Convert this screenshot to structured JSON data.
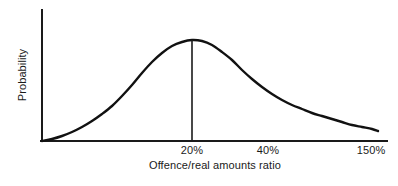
{
  "chart_data": {
    "type": "line",
    "title": "",
    "subtitle": "",
    "xlabel": "Offence/real amounts ratio",
    "ylabel": "Probability",
    "grid": false,
    "legend": null,
    "xlim": [
      0,
      160
    ],
    "ylim": [
      0,
      1.12
    ],
    "xticks": [
      {
        "value": 20,
        "label": "20%",
        "px": 192
      },
      {
        "value": 40,
        "label": "40%",
        "px": 268
      },
      {
        "value": 150,
        "label": "150%",
        "px": 371
      }
    ],
    "yticks": [],
    "annotations": [
      {
        "kind": "vertical-drop-line",
        "at_x": 20,
        "at_x_label": "20%",
        "from_y": 1.0,
        "to_y": 0.0,
        "note": "mode marker at peak of distribution"
      }
    ],
    "series": [
      {
        "name": "Probability density",
        "color": "#111111",
        "x": [
          0,
          5,
          10,
          15,
          20,
          25,
          30,
          35,
          40,
          45,
          50,
          55,
          60,
          65,
          70,
          75,
          80,
          85,
          90,
          95,
          100,
          110,
          120,
          130,
          140,
          150,
          160
        ],
        "values": [
          0.0,
          0.03,
          0.09,
          0.2,
          0.36,
          0.56,
          0.76,
          0.92,
          1.0,
          0.98,
          0.9,
          0.79,
          0.67,
          0.56,
          0.47,
          0.4,
          0.35,
          0.31,
          0.28,
          0.26,
          0.24,
          0.21,
          0.19,
          0.16,
          0.14,
          0.12,
          0.1
        ],
        "curve_pixels": [
          [
            42,
            141
          ],
          [
            52,
            139
          ],
          [
            62,
            136
          ],
          [
            72,
            132
          ],
          [
            82,
            127
          ],
          [
            92,
            121
          ],
          [
            102,
            114
          ],
          [
            112,
            106
          ],
          [
            122,
            96
          ],
          [
            132,
            85
          ],
          [
            142,
            73
          ],
          [
            152,
            62
          ],
          [
            162,
            53
          ],
          [
            172,
            46
          ],
          [
            182,
            42
          ],
          [
            192,
            40
          ],
          [
            202,
            41
          ],
          [
            212,
            45
          ],
          [
            222,
            52
          ],
          [
            232,
            60
          ],
          [
            242,
            70
          ],
          [
            252,
            79
          ],
          [
            262,
            87
          ],
          [
            272,
            94
          ],
          [
            282,
            100
          ],
          [
            292,
            105
          ],
          [
            302,
            109
          ],
          [
            312,
            113
          ],
          [
            322,
            116
          ],
          [
            332,
            119
          ],
          [
            342,
            122
          ],
          [
            352,
            125
          ],
          [
            362,
            127
          ],
          [
            372,
            129
          ],
          [
            378,
            131
          ]
        ]
      }
    ]
  },
  "axes": {
    "y_axis_name": "y-axis-line",
    "x_axis_name": "x-axis-line",
    "color": "#1a1a1a",
    "line_width_px": 2
  },
  "style": {
    "background": "#ffffff",
    "curve_color": "#111111",
    "axis_color": "#1a1a1a",
    "text_color": "#1a1a1a"
  }
}
